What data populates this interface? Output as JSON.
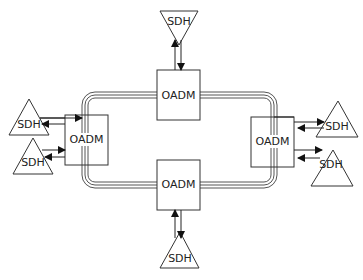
{
  "diagram": {
    "type": "optical ring network",
    "ring": {
      "lines": 3,
      "stroke_color": "#555555"
    },
    "nodes": {
      "oadm_top": {
        "label": "OADM"
      },
      "oadm_bottom": {
        "label": "OADM"
      },
      "oadm_left": {
        "label": "OADM"
      },
      "oadm_right": {
        "label": "OADM"
      },
      "sdh_top": {
        "label": "SDH"
      },
      "sdh_bottom": {
        "label": "SDH"
      },
      "sdh_left_upper": {
        "label": "SDH"
      },
      "sdh_left_lower": {
        "label": "SDH"
      },
      "sdh_right_upper": {
        "label": "SDH"
      },
      "sdh_right_lower": {
        "label": "SDH"
      }
    },
    "connections": [
      {
        "from": "oadm_top",
        "to": "sdh_top",
        "bidirectional": true
      },
      {
        "from": "oadm_bottom",
        "to": "sdh_bottom",
        "bidirectional": true
      },
      {
        "from": "oadm_left",
        "to": "sdh_left_upper",
        "bidirectional": true
      },
      {
        "from": "oadm_left",
        "to": "sdh_left_lower",
        "bidirectional": true
      },
      {
        "from": "oadm_right",
        "to": "sdh_right_upper",
        "bidirectional": true
      },
      {
        "from": "oadm_right",
        "to": "sdh_right_lower",
        "bidirectional": true
      }
    ]
  }
}
